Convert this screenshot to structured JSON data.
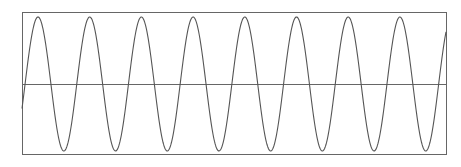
{
  "chart_data": {
    "type": "line",
    "title": "",
    "xlabel": "",
    "ylabel": "",
    "grid": false,
    "legend": null,
    "frame": {
      "left": 22,
      "top": 12,
      "right": 446,
      "bottom": 154
    },
    "baseline": {
      "y_px": 84,
      "value": 0
    },
    "series": [
      {
        "name": "sine wave",
        "function": "sin",
        "amplitude_px": 67,
        "period_px": 51.7,
        "first_peak_x_px": 38,
        "cycles_visible": 8.2,
        "peaks_x_px": [
          38,
          88,
          140,
          192,
          245,
          297,
          348,
          402
        ],
        "troughs_x_px": [
          62,
          113,
          165,
          217,
          270,
          322,
          374,
          427
        ],
        "color": "#555555"
      }
    ],
    "ylim": [
      -1,
      1
    ],
    "axis_color": "#666666"
  },
  "caption": {
    "text": ""
  }
}
